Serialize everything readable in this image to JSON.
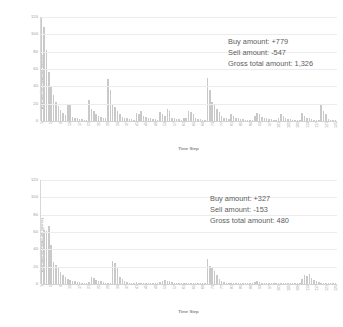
{
  "charts": [
    {
      "id": "chart-top",
      "ylabel": "Buy and Sell amount (gross)",
      "xlabel": "Time Step",
      "yticks": [
        "0",
        "20",
        "40",
        "60",
        "80",
        "100",
        "120"
      ],
      "annotation": {
        "buy": "Buy amount: +779",
        "sell": "Sell amount: -547",
        "gross": "Gross total amount: 1,326"
      }
    },
    {
      "id": "chart-bottom",
      "ylabel": "Buy and Sell amount (gross)",
      "xlabel": "Time Step",
      "yticks": [
        "0",
        "20",
        "40",
        "60",
        "80",
        "100",
        "120"
      ],
      "annotation": {
        "buy": "Buy amount: +327",
        "sell": "Sell amount: -153",
        "gross": "Gross total amount: 480"
      }
    }
  ],
  "chart_data": [
    {
      "type": "bar",
      "title": "",
      "xlabel": "Time Step",
      "ylabel": "Buy and Sell amount (gross)",
      "ylim": [
        0,
        120
      ],
      "ytick_values": [
        0,
        20,
        40,
        60,
        80,
        100,
        120
      ],
      "xlim": [
        1,
        125
      ],
      "xtick_values": [
        1,
        5,
        9,
        13,
        17,
        21,
        25,
        29,
        33,
        37,
        41,
        45,
        49,
        53,
        57,
        61,
        65,
        69,
        73,
        77,
        81,
        85,
        89,
        93,
        97,
        101,
        105,
        109,
        113,
        117,
        121,
        125
      ],
      "grid": true,
      "legend": false,
      "bar_color": "#c9c9c9",
      "annotations": [
        "Buy amount: +779",
        "Sell amount: -547",
        "Gross total amount: 1,326"
      ],
      "x": [
        1,
        2,
        3,
        4,
        5,
        6,
        7,
        8,
        9,
        10,
        11,
        12,
        13,
        14,
        15,
        16,
        17,
        18,
        19,
        20,
        21,
        22,
        23,
        24,
        25,
        26,
        27,
        28,
        29,
        30,
        31,
        32,
        33,
        34,
        35,
        36,
        37,
        38,
        39,
        40,
        41,
        42,
        43,
        44,
        45,
        46,
        47,
        48,
        49,
        50,
        51,
        52,
        53,
        54,
        55,
        56,
        57,
        58,
        59,
        60,
        61,
        62,
        63,
        64,
        65,
        66,
        67,
        68,
        69,
        70,
        71,
        72,
        73,
        74,
        75,
        76,
        77,
        78,
        79,
        80,
        81,
        82,
        83,
        84,
        85,
        86,
        87,
        88,
        89,
        90,
        91,
        92,
        93,
        94,
        95,
        96,
        97,
        98,
        99,
        100,
        101,
        102,
        103,
        104,
        105,
        106,
        107,
        108,
        109,
        110,
        111,
        112,
        113,
        114,
        115,
        116,
        117,
        118,
        119,
        120,
        121,
        122,
        123,
        124,
        125
      ],
      "values": [
        120,
        108,
        82,
        56,
        40,
        30,
        22,
        17,
        13,
        9,
        7,
        20,
        18,
        5,
        4,
        3,
        2,
        2,
        1,
        1,
        24,
        14,
        12,
        8,
        6,
        5,
        4,
        3,
        48,
        36,
        20,
        16,
        12,
        8,
        5,
        4,
        3,
        2,
        2,
        1,
        9,
        8,
        12,
        6,
        5,
        4,
        3,
        2,
        2,
        1,
        10,
        8,
        6,
        14,
        12,
        4,
        3,
        2,
        2,
        1,
        4,
        3,
        12,
        10,
        8,
        3,
        2,
        2,
        1,
        1,
        50,
        36,
        22,
        18,
        14,
        10,
        6,
        4,
        3,
        2,
        8,
        6,
        4,
        3,
        2,
        2,
        1,
        1,
        1,
        1,
        6,
        9,
        8,
        5,
        4,
        3,
        2,
        2,
        1,
        1,
        4,
        8,
        6,
        3,
        2,
        2,
        1,
        1,
        1,
        1,
        9,
        6,
        4,
        3,
        2,
        1,
        1,
        1,
        18,
        12,
        8,
        2,
        1,
        1,
        1
      ]
    },
    {
      "type": "bar",
      "title": "",
      "xlabel": "Time Step",
      "ylabel": "Buy and Sell amount (gross)",
      "ylim": [
        0,
        120
      ],
      "ytick_values": [
        0,
        20,
        40,
        60,
        80,
        100,
        120
      ],
      "xlim": [
        1,
        125
      ],
      "xtick_values": [
        1,
        5,
        9,
        13,
        17,
        21,
        25,
        29,
        33,
        37,
        41,
        45,
        49,
        53,
        57,
        61,
        65,
        69,
        73,
        77,
        81,
        85,
        89,
        93,
        97,
        101,
        105,
        109,
        113,
        117,
        121,
        125
      ],
      "grid": true,
      "legend": false,
      "bar_color": "#c9c9c9",
      "annotations": [
        "Buy amount: +327",
        "Sell amount: -153",
        "Gross total amount: 480"
      ],
      "x": [
        1,
        2,
        3,
        4,
        5,
        6,
        7,
        8,
        9,
        10,
        11,
        12,
        13,
        14,
        15,
        16,
        17,
        18,
        19,
        20,
        21,
        22,
        23,
        24,
        25,
        26,
        27,
        28,
        29,
        30,
        31,
        32,
        33,
        34,
        35,
        36,
        37,
        38,
        39,
        40,
        41,
        42,
        43,
        44,
        45,
        46,
        47,
        48,
        49,
        50,
        51,
        52,
        53,
        54,
        55,
        56,
        57,
        58,
        59,
        60,
        61,
        62,
        63,
        64,
        65,
        66,
        67,
        68,
        69,
        70,
        71,
        72,
        73,
        74,
        75,
        76,
        77,
        78,
        79,
        80,
        81,
        82,
        83,
        84,
        85,
        86,
        87,
        88,
        89,
        90,
        91,
        92,
        93,
        94,
        95,
        96,
        97,
        98,
        99,
        100,
        101,
        102,
        103,
        104,
        105,
        106,
        107,
        108,
        109,
        110,
        111,
        112,
        113,
        114,
        115,
        116,
        117,
        118,
        119,
        120,
        121,
        122,
        123,
        124,
        125
      ],
      "values": [
        43,
        62,
        61,
        67,
        45,
        25,
        22,
        18,
        14,
        10,
        8,
        6,
        5,
        4,
        3,
        2,
        2,
        1,
        1,
        1,
        2,
        8,
        7,
        5,
        4,
        3,
        2,
        1,
        1,
        1,
        26,
        24,
        20,
        8,
        6,
        4,
        2,
        1,
        1,
        1,
        2,
        1,
        1,
        1,
        1,
        1,
        1,
        1,
        1,
        1,
        2,
        4,
        5,
        4,
        3,
        2,
        1,
        1,
        1,
        1,
        1,
        1,
        1,
        1,
        1,
        1,
        1,
        1,
        1,
        1,
        29,
        21,
        20,
        15,
        10,
        6,
        4,
        2,
        1,
        1,
        1,
        1,
        1,
        1,
        1,
        1,
        1,
        1,
        1,
        1,
        2,
        3,
        2,
        1,
        1,
        1,
        1,
        1,
        1,
        1,
        1,
        1,
        1,
        1,
        1,
        1,
        1,
        1,
        1,
        1,
        6,
        10,
        9,
        11,
        7,
        5,
        3,
        2,
        1,
        1,
        1,
        1,
        1,
        1,
        1
      ]
    }
  ]
}
